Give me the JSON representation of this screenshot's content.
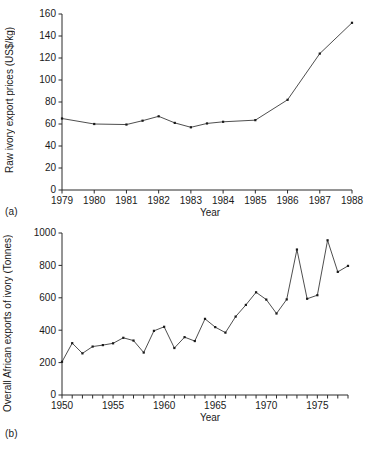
{
  "figure": {
    "panel_a_label": "(a)",
    "panel_b_label": "(b)"
  },
  "chart_data": [
    {
      "id": "a",
      "type": "line",
      "title": "",
      "xlabel": "Year",
      "ylabel": "Raw ivory export prices (US$/kg)",
      "xlim": [
        1979,
        1988
      ],
      "ylim": [
        0,
        160
      ],
      "xticks": [
        1979,
        1980,
        1981,
        1982,
        1983,
        1984,
        1985,
        1986,
        1987,
        1988
      ],
      "xticklabels": [
        "1979",
        "1980",
        "1981",
        "1982",
        "1983",
        "1984",
        "1985",
        "1986",
        "1987",
        "1988"
      ],
      "yticks": [
        0,
        20,
        40,
        60,
        80,
        100,
        120,
        140,
        160
      ],
      "yticklabels": [
        "0",
        "20",
        "40",
        "60",
        "80",
        "100",
        "120",
        "140",
        "160"
      ],
      "grid": false,
      "legend": "none",
      "markers": "square",
      "x": [
        1979,
        1980,
        1981,
        1981.5,
        1982,
        1982.5,
        1983,
        1983.5,
        1984,
        1985,
        1986,
        1987,
        1988
      ],
      "values": [
        65,
        60,
        59.5,
        63,
        67,
        61,
        57,
        60.5,
        62,
        63.5,
        82,
        124,
        152
      ]
    },
    {
      "id": "b",
      "type": "line",
      "title": "",
      "xlabel": "Year",
      "ylabel": "Overall African exports of ivory (Tonnes)",
      "xlim": [
        1950,
        1978
      ],
      "ylim": [
        0,
        1000
      ],
      "xticks": [
        1950,
        1951,
        1952,
        1953,
        1954,
        1955,
        1956,
        1957,
        1958,
        1959,
        1960,
        1961,
        1962,
        1963,
        1964,
        1965,
        1966,
        1967,
        1968,
        1969,
        1970,
        1971,
        1972,
        1973,
        1974,
        1975,
        1976,
        1977,
        1978
      ],
      "xticklabels_major": {
        "1950": "1950",
        "1955": "1955",
        "1960": "1960",
        "1965": "1965",
        "1970": "1970",
        "1975": "1975"
      },
      "yticks": [
        0,
        200,
        400,
        600,
        800,
        1000
      ],
      "yticklabels": [
        "0",
        "200",
        "400",
        "600",
        "800",
        "1000"
      ],
      "grid": false,
      "legend": "none",
      "markers": "square",
      "x": [
        1950,
        1951,
        1952,
        1953,
        1954,
        1955,
        1956,
        1957,
        1958,
        1959,
        1960,
        1961,
        1962,
        1963,
        1964,
        1965,
        1966,
        1967,
        1968,
        1969,
        1970,
        1971,
        1972,
        1973,
        1974,
        1975,
        1976,
        1977,
        1978
      ],
      "values": [
        205,
        320,
        257,
        299,
        308,
        319,
        353,
        336,
        262,
        396,
        421,
        290,
        357,
        333,
        470,
        419,
        385,
        484,
        556,
        634,
        589,
        503,
        590,
        898,
        594,
        616,
        955,
        760,
        797
      ]
    }
  ]
}
